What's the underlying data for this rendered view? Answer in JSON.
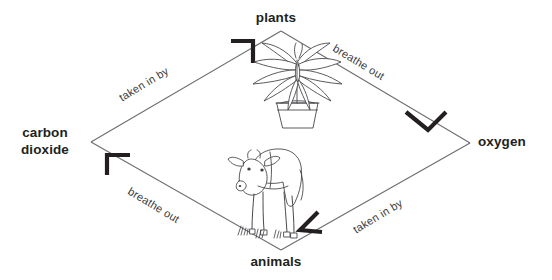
{
  "diagram": {
    "type": "cycle-diagram",
    "shape": "diamond",
    "background_color": "#ffffff",
    "line_color": "#58595b",
    "arrow_color": "#231f20",
    "label_color": "#231f20",
    "edge_label_color": "#3a3a3c",
    "nodes": [
      {
        "id": "plants",
        "label": "plants",
        "position": "top",
        "x": 281,
        "y": 18
      },
      {
        "id": "oxygen",
        "label": "oxygen",
        "position": "right",
        "x": 508,
        "y": 140
      },
      {
        "id": "animals",
        "label": "animals",
        "position": "bottom",
        "x": 281,
        "y": 262
      },
      {
        "id": "carbon_dioxide",
        "label": "carbon\ndioxide",
        "position": "left",
        "x": 45,
        "y": 140
      }
    ],
    "edges": [
      {
        "id": "co2-to-plants",
        "from": "carbon_dioxide",
        "to": "plants",
        "label": "taken in by",
        "arrow_direction": "up-right"
      },
      {
        "id": "plants-to-oxygen",
        "from": "plants",
        "to": "oxygen",
        "label": "breathe out",
        "arrow_direction": "down-right"
      },
      {
        "id": "oxygen-to-animals",
        "from": "oxygen",
        "to": "animals",
        "label": "taken in by",
        "arrow_direction": "down-left"
      },
      {
        "id": "animals-to-co2",
        "from": "animals",
        "to": "carbon_dioxide",
        "label": "breathe out",
        "arrow_direction": "up-left"
      }
    ],
    "illustrations": [
      {
        "id": "potted-plant",
        "name": "potted-plant-illustration",
        "subject": "houseplant in a pot",
        "x": 296,
        "y": 88
      },
      {
        "id": "cow",
        "name": "cow-illustration",
        "subject": "cow standing on grass",
        "x": 262,
        "y": 190
      }
    ]
  }
}
